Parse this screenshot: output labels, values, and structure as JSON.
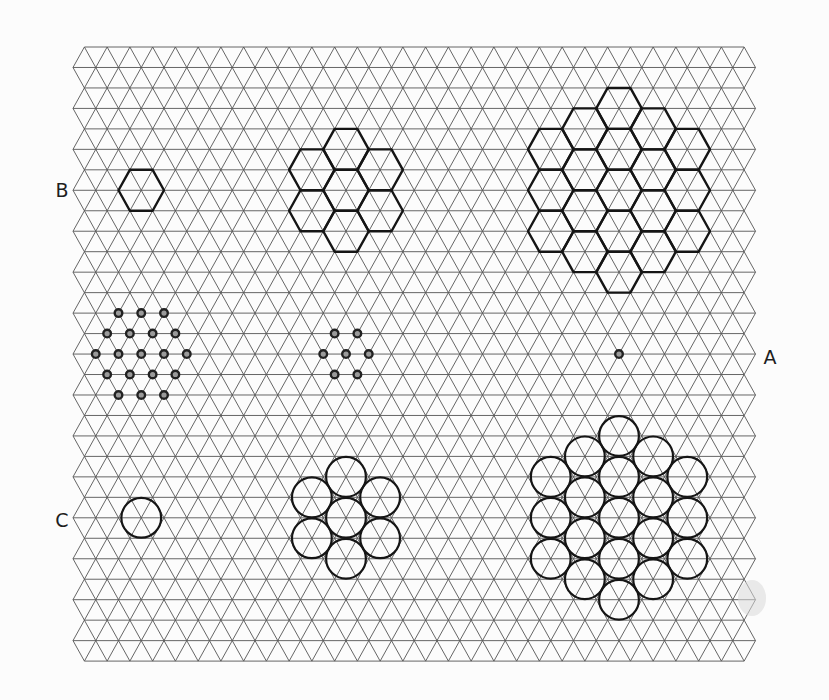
{
  "figure": {
    "width": 829,
    "height": 700,
    "colors": {
      "background": "#fcfcfc",
      "grid": "#555555",
      "ink": "#151515"
    },
    "grid": {
      "top_y": 47,
      "row_spacing": 20.47,
      "rows": 31,
      "left_x_odd": 73,
      "left_x_even": 84.4,
      "dx": 22.75,
      "vertices_odd": 31,
      "vertices_even": 30
    },
    "labels": [
      {
        "id": "B",
        "text": "B",
        "x": 62,
        "y": 190
      },
      {
        "id": "A",
        "text": "A",
        "x": 770,
        "y": 357
      },
      {
        "id": "C",
        "text": "C",
        "x": 62,
        "y": 520
      }
    ],
    "rows": {
      "B": {
        "description": "hexagon clusters",
        "groups": [
          {
            "count": 1,
            "center_col": 3,
            "center_row": 7,
            "rings": 0
          },
          {
            "count": 7,
            "center_col": 12,
            "center_row": 7,
            "rings": 1
          },
          {
            "count": 19,
            "center_col": 24,
            "center_row": 7,
            "rings": 2
          }
        ]
      },
      "A": {
        "description": "point clusters",
        "groups": [
          {
            "count": 19,
            "center_col": 3,
            "center_row": 15,
            "rings": 2
          },
          {
            "count": 7,
            "center_col": 12,
            "center_row": 15,
            "rings": 1
          },
          {
            "count": 1,
            "center_col": 24,
            "center_row": 15,
            "rings": 0
          }
        ]
      },
      "C": {
        "description": "circle clusters",
        "groups": [
          {
            "count": 1,
            "center_col": 3,
            "center_row": 23,
            "rings": 0
          },
          {
            "count": 7,
            "center_col": 12,
            "center_row": 23,
            "rings": 1
          },
          {
            "count": 19,
            "center_col": 24,
            "center_row": 23,
            "rings": 2
          }
        ]
      }
    },
    "shape_sizes": {
      "circle_radius": 19.9,
      "dot_radius": 3.8
    }
  }
}
